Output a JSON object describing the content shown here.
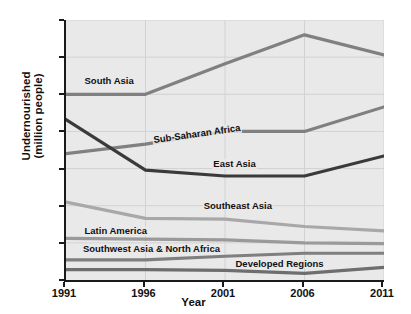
{
  "chart_data": {
    "type": "line",
    "title": "",
    "xlabel": "Year",
    "ylabel": "Undernourished (million people)",
    "ylabel_line1": "Undernourished",
    "ylabel_line2": "(million people)",
    "x": [
      1991,
      1996,
      2001,
      2006,
      2011
    ],
    "xticklabels": [
      "1991",
      "1996",
      "2001",
      "2006",
      "2011"
    ],
    "yticks": [
      0,
      50,
      100,
      150,
      200,
      250,
      300,
      350
    ],
    "yticklabels": [
      "0",
      "50",
      "100",
      "150",
      "200",
      "250",
      "300",
      "350"
    ],
    "xlim": [
      1991,
      2011
    ],
    "ylim": [
      0,
      350
    ],
    "grid": true,
    "legend": "inline-labels",
    "series": [
      {
        "name": "South Asia",
        "values": [
          250,
          250,
          291,
          330,
          303
        ],
        "color": "#808080",
        "width": 3.2,
        "label_x": 1992.1,
        "label_y": 268
      },
      {
        "name": "Sub-Saharan Africa",
        "values": [
          170,
          183,
          200,
          200,
          233
        ],
        "color": "#808080",
        "width": 3.2,
        "label_x": 1996.4,
        "label_y": 196
      },
      {
        "name": "East Asia",
        "values": [
          216,
          148,
          140,
          140,
          167
        ],
        "color": "#3a3a3a",
        "width": 3.2,
        "label_x": 2000.2,
        "label_y": 156
      },
      {
        "name": "Southeast Asia",
        "values": [
          105,
          83,
          82,
          72,
          66
        ],
        "color": "#a8a8a8",
        "width": 3.2,
        "label_x": 1999.6,
        "label_y": 100
      },
      {
        "name": "Latin America",
        "values": [
          56,
          55,
          54,
          50,
          49
        ],
        "color": "#9a9a9a",
        "width": 3.2,
        "label_x": 1992.1,
        "label_y": 66
      },
      {
        "name": "Southwest Asia & North Africa",
        "values": [
          27,
          27,
          32,
          36,
          36
        ],
        "color": "#7f7f7f",
        "width": 3.2,
        "label_x": 1992.0,
        "label_y": 42
      },
      {
        "name": "Developed Regions",
        "values": [
          14,
          14,
          13,
          9,
          17
        ],
        "color": "#6e6e6e",
        "width": 3.2,
        "label_x": 2001.6,
        "label_y": 22
      }
    ]
  },
  "colors": {
    "plot_background": "#e9e9e9",
    "axis": "#1a1a1a",
    "gridline": "#d2d2d2",
    "page_background": "#ffffff",
    "text": "#111111"
  }
}
